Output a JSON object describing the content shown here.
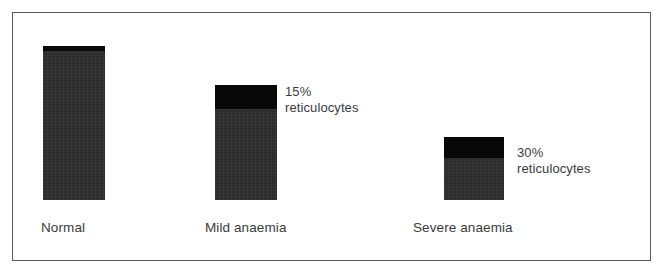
{
  "figure": {
    "kind": "bar-chart-diagram",
    "border_color": "#5a5a5a",
    "background_color": "#ffffff"
  },
  "chart_data": {
    "type": "bar",
    "title": "",
    "subtitle": "",
    "xlabel": "",
    "ylabel": "",
    "grid": false,
    "legend": false,
    "stacked": true,
    "ylim": [
      0,
      100
    ],
    "axis_ticks": [],
    "categories": [
      "Normal",
      "Mild anaemia",
      "Severe anaemia"
    ],
    "series": [
      {
        "name": "mature red cells",
        "color": "#2c2c2c",
        "values": [
          99,
          85,
          67
        ]
      },
      {
        "name": "reticulocytes",
        "color": "#080808",
        "values": [
          1,
          15,
          30
        ]
      }
    ],
    "total_heights_percent": [
      100,
      75,
      41
    ],
    "annotations": [
      {
        "attached_to": "Mild anaemia",
        "percent": "15%",
        "term": "reticulocytes"
      },
      {
        "attached_to": "Severe anaemia",
        "percent": "30%",
        "term": "reticulocytes"
      }
    ]
  },
  "bars": [
    {
      "id": "normal",
      "label": "Normal",
      "cap_label": "",
      "x": 43,
      "width": 62,
      "top": 46,
      "height": 154,
      "cap_height": 5,
      "body_color": "#2c2c2c",
      "cap_color": "#080808"
    },
    {
      "id": "mild-anaemia",
      "label": "Mild anaemia",
      "cap_label": "15%",
      "x": 215,
      "width": 62,
      "top": 85,
      "height": 115,
      "cap_height": 24,
      "body_color": "#2c2c2c",
      "cap_color": "#080808"
    },
    {
      "id": "severe-anaemia",
      "label": "Severe anaemia",
      "cap_label": "30%",
      "x": 444,
      "width": 60,
      "top": 137,
      "height": 63,
      "cap_height": 21,
      "body_color": "#2c2c2c",
      "cap_color": "#080808"
    }
  ],
  "labels": [
    {
      "text": "Normal",
      "x": 41,
      "y": 220
    },
    {
      "text": "Mild anaemia",
      "x": 205,
      "y": 220
    },
    {
      "text": "Severe anaemia",
      "x": 413,
      "y": 220
    }
  ],
  "callouts": [
    {
      "percent": "15%",
      "term": "reticulocytes",
      "x": 285,
      "y": 84
    },
    {
      "percent": "30%",
      "term": "reticulocytes",
      "x": 517,
      "y": 145
    }
  ]
}
